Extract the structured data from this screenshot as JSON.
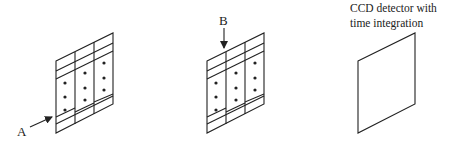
{
  "diagram": {
    "panels": [
      {
        "id": "grating-A",
        "label": "A",
        "arrow_direction": "from-lower-left",
        "columns": 3,
        "dots_per_column": [
          3,
          3,
          3
        ]
      },
      {
        "id": "grating-B",
        "label": "B",
        "arrow_direction": "from-top",
        "columns": 3,
        "dots_per_column": [
          3,
          3,
          3
        ]
      },
      {
        "id": "ccd-detector",
        "caption_line1": "CCD detector with",
        "caption_line2": "time integration"
      }
    ],
    "colors": {
      "stroke": "#222222",
      "background": "#ffffff"
    }
  }
}
